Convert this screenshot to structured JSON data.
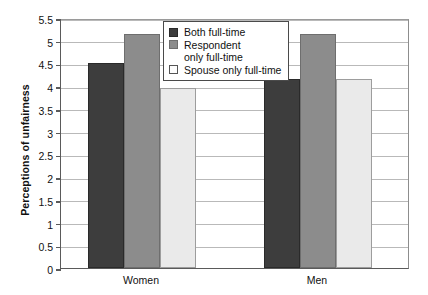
{
  "chart_data": {
    "type": "bar",
    "title": "",
    "xlabel": "",
    "ylabel": "Perceptions of unfairness",
    "categories": [
      "Women",
      "Men"
    ],
    "ylim": [
      0,
      5.5
    ],
    "yticks": [
      "0",
      "0.5",
      "1",
      "1.5",
      "2",
      "2.5",
      "3",
      "3.5",
      "4",
      "4.5",
      "5",
      "5.5"
    ],
    "ytick_values": [
      0,
      0.5,
      1,
      1.5,
      2,
      2.5,
      3,
      3.5,
      4,
      4.5,
      5,
      5.5
    ],
    "grid": true,
    "legend_position": "top-center",
    "series": [
      {
        "name": "Both full-time",
        "name_line1": "Both full-time",
        "name_line2": "",
        "color": "#3d3d3d",
        "values": [
          4.5,
          4.15
        ]
      },
      {
        "name": "Respondent only full-time",
        "name_line1": "Respondent",
        "name_line2": "only full-time",
        "color": "#8c8c8c",
        "values": [
          5.15,
          5.15
        ]
      },
      {
        "name": "Spouse only full-time",
        "name_line1": "Spouse only full-time",
        "name_line2": "",
        "color": "#eaeaea",
        "values": [
          3.95,
          4.15
        ]
      }
    ]
  }
}
